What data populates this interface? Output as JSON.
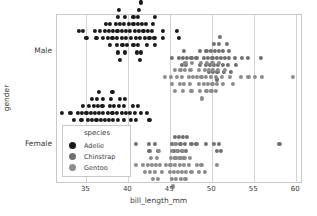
{
  "chart_data": {
    "type": "scatter",
    "title": "",
    "xlabel": "bill_length_mm",
    "ylabel": "gender",
    "xlim": [
      31.5,
      60.8
    ],
    "xticks": [
      35,
      40,
      45,
      50,
      55,
      60
    ],
    "xtick_labels": [
      "35",
      "40",
      "45",
      "50",
      "55",
      "60"
    ],
    "ycategories": [
      "Male",
      "Female"
    ],
    "grid": "vertical",
    "legend": {
      "title": "species",
      "position": "lower-left-inside",
      "entries": [
        {
          "name": "Adelie",
          "color": "#1a1a1a"
        },
        {
          "name": "Chinstrap",
          "color": "#707070"
        },
        {
          "name": "Gentoo",
          "color": "#8c8c8c"
        }
      ]
    },
    "series": [
      {
        "name": "Adelie",
        "gender": "Male",
        "color": "#1a1a1a",
        "row": 0,
        "x": [
          34.1,
          34.6,
          35.0,
          36.0,
          36.2,
          36.6,
          37.0,
          37.2,
          37.3,
          37.6,
          37.7,
          37.8,
          37.8,
          38.1,
          38.2,
          38.5,
          38.6,
          38.6,
          38.7,
          38.8,
          38.8,
          38.9,
          39.0,
          39.0,
          39.2,
          39.2,
          39.3,
          39.5,
          39.6,
          39.6,
          39.7,
          39.7,
          39.8,
          40.1,
          40.2,
          40.3,
          40.6,
          40.6,
          40.6,
          40.8,
          40.9,
          41.0,
          41.1,
          41.1,
          41.1,
          41.3,
          41.3,
          41.4,
          41.4,
          41.5,
          41.5,
          41.6,
          41.8,
          42.0,
          42.1,
          42.2,
          42.3,
          42.5,
          42.8,
          42.9,
          43.1,
          43.2,
          43.2,
          44.1,
          44.1,
          45.8,
          46.0
        ]
      },
      {
        "name": "Chinstrap",
        "gender": "Male",
        "color": "#707070",
        "row": 1,
        "x": [
          45.2,
          46.0,
          46.4,
          46.5,
          46.6,
          46.9,
          47.0,
          47.5,
          48.1,
          48.5,
          48.5,
          49.0,
          49.2,
          49.3,
          49.5,
          49.6,
          49.7,
          49.8,
          50.0,
          50.1,
          50.2,
          50.2,
          50.3,
          50.5,
          50.5,
          50.6,
          50.7,
          50.8,
          50.8,
          50.9,
          51.0,
          51.3,
          51.3,
          51.4,
          51.5,
          51.7,
          51.9,
          52.0,
          52.0,
          52.2,
          52.7,
          52.8,
          53.5,
          54.2,
          55.8
        ]
      },
      {
        "name": "Gentoo",
        "gender": "Male",
        "color": "#8c8c8c",
        "row": 2,
        "x": [
          44.4,
          45.1,
          45.2,
          45.5,
          45.5,
          45.8,
          46.1,
          46.2,
          46.4,
          46.5,
          46.6,
          46.7,
          46.8,
          47.2,
          47.3,
          47.4,
          47.5,
          47.6,
          47.7,
          48.2,
          48.4,
          48.4,
          48.5,
          48.6,
          48.7,
          48.8,
          49.0,
          49.1,
          49.2,
          49.3,
          49.4,
          49.5,
          49.6,
          49.8,
          49.9,
          50.0,
          50.0,
          50.1,
          50.4,
          50.4,
          50.5,
          50.7,
          50.8,
          51.1,
          51.3,
          51.5,
          52.1,
          52.5,
          53.4,
          54.3,
          55.1,
          55.9,
          59.6
        ]
      },
      {
        "name": "Adelie",
        "gender": "Female",
        "color": "#1a1a1a",
        "row": 3,
        "x": [
          32.1,
          33.1,
          33.5,
          34.0,
          34.4,
          34.5,
          34.6,
          35.0,
          35.2,
          35.3,
          35.5,
          35.6,
          35.7,
          35.7,
          35.9,
          35.9,
          36.0,
          36.2,
          36.2,
          36.3,
          36.4,
          36.4,
          36.5,
          36.5,
          36.6,
          36.7,
          36.8,
          36.9,
          37.0,
          37.0,
          37.2,
          37.3,
          37.6,
          37.7,
          37.8,
          37.8,
          37.9,
          37.9,
          38.1,
          38.1,
          38.2,
          38.3,
          38.6,
          38.8,
          38.9,
          38.9,
          39.0,
          39.2,
          39.5,
          39.5,
          39.6,
          39.6,
          39.7,
          40.2,
          40.3,
          40.5,
          40.8,
          40.9,
          41.1,
          41.5,
          42.2,
          42.5
        ]
      },
      {
        "name": "Chinstrap",
        "gender": "Female",
        "color": "#707070",
        "row": 4,
        "x": [
          40.9,
          42.4,
          42.5,
          43.2,
          43.5,
          45.2,
          45.4,
          45.5,
          45.6,
          45.7,
          45.9,
          46.0,
          46.1,
          46.2,
          46.4,
          46.5,
          46.6,
          46.7,
          46.9,
          47.0,
          47.5,
          48.1,
          49.2,
          50.2,
          50.5,
          50.8,
          51.0,
          58.0
        ]
      },
      {
        "name": "Gentoo",
        "gender": "Female",
        "color": "#8c8c8c",
        "row": 5,
        "x": [
          40.9,
          41.7,
          42.0,
          42.3,
          42.6,
          42.7,
          42.8,
          42.9,
          43.2,
          43.3,
          43.4,
          43.5,
          43.6,
          43.8,
          44.0,
          44.5,
          44.9,
          45.0,
          45.1,
          45.2,
          45.2,
          45.3,
          45.4,
          45.5,
          45.5,
          45.6,
          45.7,
          45.8,
          45.9,
          46.1,
          46.2,
          46.3,
          46.4,
          46.5,
          46.6,
          46.7,
          46.8,
          46.9,
          47.2,
          47.3,
          47.5,
          48.2,
          48.4,
          48.7,
          49.1,
          50.5
        ]
      }
    ]
  },
  "axis": {
    "xlabel": "bill_length_mm",
    "ylabel": "gender",
    "xticks": [
      "35",
      "40",
      "45",
      "50",
      "55",
      "60"
    ],
    "yticks": [
      "Male",
      "Female"
    ]
  },
  "legend": {
    "title": "species",
    "items": [
      "Adelie",
      "Chinstrap",
      "Gentoo"
    ]
  },
  "colors": {
    "adelie": "#1a1a1a",
    "chinstrap": "#707070",
    "gentoo": "#8c8c8c",
    "grid": "#d4d4d4",
    "frame": "#c9c9c9",
    "text": "#3a3a3a",
    "background": "#ffffff"
  }
}
